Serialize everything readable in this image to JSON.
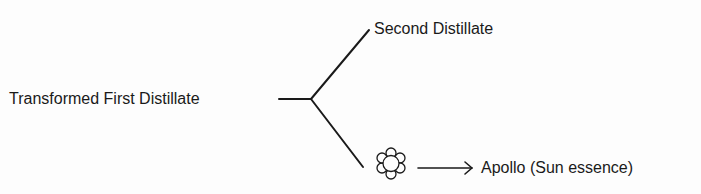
{
  "diagram": {
    "source_node": {
      "label": "Transformed First Distillate"
    },
    "branches": [
      {
        "label": "Second Distillate"
      },
      {
        "icon": "flower-icon",
        "arrow": "right-arrow",
        "label": "Apollo (Sun essence)"
      }
    ],
    "stroke_color": "#1a1a1a"
  }
}
